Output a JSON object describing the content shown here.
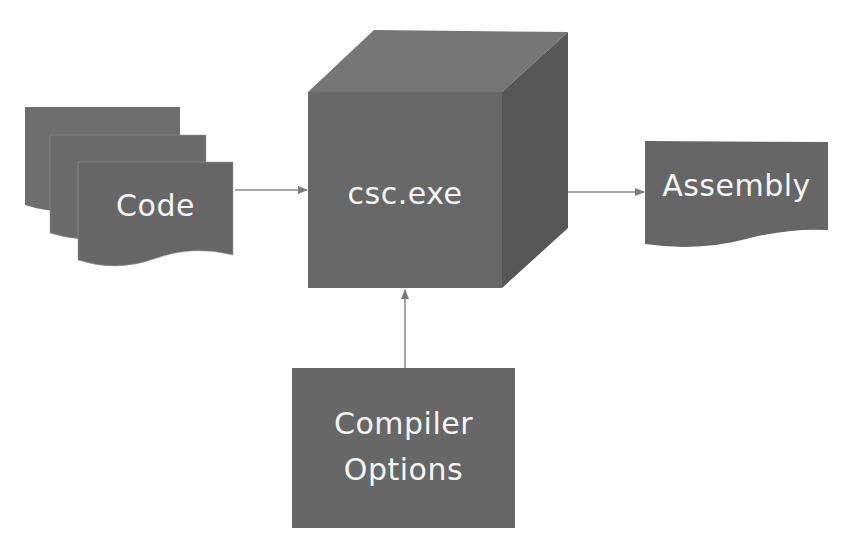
{
  "diagram": {
    "nodes": {
      "code": {
        "label": "Code",
        "shape": "multi-document"
      },
      "compiler": {
        "label": "csc.exe",
        "shape": "cube"
      },
      "assembly": {
        "label": "Assembly",
        "shape": "document"
      },
      "options": {
        "label_line1": "Compiler",
        "label_line2": "Options",
        "shape": "rectangle"
      }
    },
    "edges": [
      {
        "from": "Code",
        "to": "csc.exe"
      },
      {
        "from": "csc.exe",
        "to": "Assembly"
      },
      {
        "from": "Compiler Options",
        "to": "csc.exe"
      }
    ],
    "colors": {
      "shape_fill": "#6b6b6b",
      "cube_top": "#767676",
      "cube_side": "#555555",
      "text": "#f4f4f4",
      "arrow": "#8a8a8a",
      "background": "#ffffff"
    }
  }
}
